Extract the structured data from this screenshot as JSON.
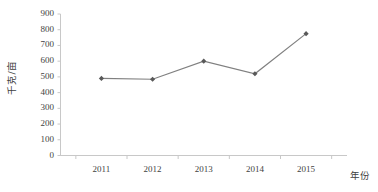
{
  "chart_data": {
    "type": "line",
    "title": "",
    "subtitle": "",
    "xlabel": "年份",
    "ylabel": "千克/亩",
    "categories": [
      "2011",
      "2012",
      "2013",
      "2014",
      "2015"
    ],
    "values": [
      490,
      485,
      600,
      520,
      775
    ],
    "series": [
      {
        "name": "",
        "values": [
          490,
          485,
          600,
          520,
          775
        ]
      }
    ],
    "ylim": [
      0,
      900
    ],
    "ytick_labels": [
      "0",
      "100",
      "200",
      "300",
      "400",
      "500",
      "600",
      "700",
      "800",
      "900"
    ],
    "ytick_values": [
      0,
      100,
      200,
      300,
      400,
      500,
      600,
      700,
      800,
      900
    ],
    "grid": false,
    "legend": "none",
    "marker": "diamond",
    "line_color": "#808080",
    "marker_color": "#595959",
    "axis_color": "#c8c8c8",
    "text_color": "#3f3f3f",
    "background": "#ffffff"
  }
}
